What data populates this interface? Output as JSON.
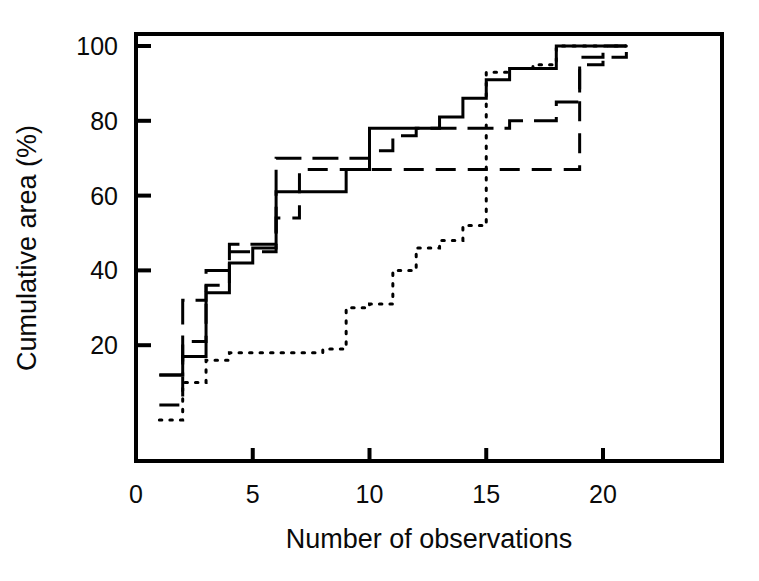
{
  "figure": {
    "background": "#ffffff",
    "ink": "#000000"
  },
  "chart_data": {
    "type": "line",
    "title": "",
    "subtitle": "",
    "xlabel": "Number of observations",
    "ylabel": "Cumulative area (%)",
    "xlim": [
      0,
      22.5
    ],
    "ylim": [
      0,
      104
    ],
    "xticks": [
      0,
      5,
      10,
      15,
      20
    ],
    "xtick_labels": [
      "0",
      "5",
      "10",
      "15",
      "20"
    ],
    "yticks": [
      20,
      40,
      60,
      80,
      100
    ],
    "ytick_labels": [
      "20",
      "40",
      "60",
      "80",
      "100"
    ],
    "grid": false,
    "legend": "none",
    "annotations": [],
    "frame": "box",
    "step_style": "post",
    "series": [
      {
        "name": "solid-curve",
        "dash": "solid",
        "stroke": "#000000",
        "x": [
          1,
          2,
          3,
          4,
          5,
          6,
          7,
          8,
          9,
          10,
          11,
          12,
          13,
          14,
          15,
          16,
          17,
          18,
          19,
          20,
          21
        ],
        "y": [
          12,
          17,
          34,
          42,
          46,
          61,
          61,
          61,
          67,
          78,
          78,
          78,
          81,
          86,
          91,
          94,
          94,
          100,
          100,
          100,
          100
        ]
      },
      {
        "name": "long-dash-curve",
        "dash": "long",
        "stroke": "#000000",
        "x": [
          1,
          2,
          3,
          4,
          5,
          6,
          7,
          8,
          9,
          10,
          11,
          12,
          13,
          14,
          15,
          16,
          17,
          18,
          19,
          20,
          21
        ],
        "y": [
          12,
          32,
          40,
          47,
          47,
          70,
          70,
          70,
          70,
          72,
          76,
          78,
          78,
          78,
          78,
          80,
          80,
          85,
          97,
          100,
          100
        ]
      },
      {
        "name": "medium-dash-curve",
        "dash": "medium",
        "stroke": "#000000",
        "x": [
          1,
          2,
          3,
          4,
          5,
          6,
          7,
          8,
          9,
          10,
          11,
          12,
          13,
          14,
          15,
          16,
          17,
          18,
          19,
          20,
          21
        ],
        "y": [
          4,
          21,
          36,
          45,
          45,
          54,
          67,
          67,
          67,
          67,
          67,
          67,
          67,
          67,
          67,
          67,
          67,
          67,
          95,
          97,
          100
        ]
      },
      {
        "name": "dotted-curve",
        "dash": "dotted",
        "stroke": "#000000",
        "x": [
          1,
          2,
          3,
          4,
          5,
          6,
          7,
          8,
          9,
          10,
          11,
          12,
          13,
          14,
          15,
          16,
          17,
          18,
          19,
          20,
          21
        ],
        "y": [
          0,
          10,
          16,
          18,
          18,
          18,
          18,
          19,
          30,
          31,
          40,
          46,
          48,
          52,
          93,
          94,
          95,
          100,
          100,
          100,
          100
        ]
      }
    ]
  }
}
